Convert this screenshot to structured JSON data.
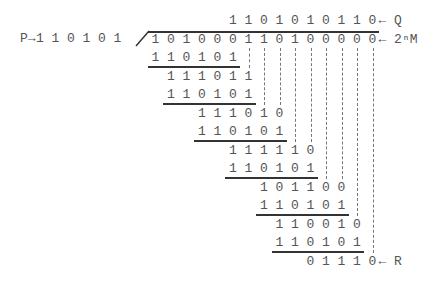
{
  "divisor_label": "P→",
  "divisor_bits": [
    "1",
    "1",
    "0",
    "1",
    "0",
    "1"
  ],
  "quotient_bits": [
    "1",
    "1",
    "0",
    "1",
    "0",
    "1",
    "0",
    "1",
    "1",
    "0"
  ],
  "quotient_label": "← Q",
  "dividend_bits": [
    "1",
    "0",
    "1",
    "0",
    "0",
    "0",
    "1",
    "1",
    "0",
    "1",
    "0",
    "0",
    "0",
    "0",
    "0"
  ],
  "dividend_label": "← 2ⁿM",
  "steps": [
    {
      "subtrahend": [
        "1",
        "1",
        "0",
        "1",
        "0",
        "1"
      ]
    },
    {
      "remainder": [
        "1",
        "1",
        "1",
        "0",
        "1",
        "1"
      ],
      "subtrahend": [
        "1",
        "1",
        "0",
        "1",
        "0",
        "1"
      ]
    },
    {
      "remainder": [
        "1",
        "1",
        "1",
        "0",
        "1",
        "0"
      ],
      "subtrahend": [
        "1",
        "1",
        "0",
        "1",
        "0",
        "1"
      ]
    },
    {
      "remainder": [
        "1",
        "1",
        "1",
        "1",
        "1",
        "0"
      ],
      "subtrahend": [
        "1",
        "1",
        "0",
        "1",
        "0",
        "1"
      ]
    },
    {
      "remainder": [
        "1",
        "0",
        "1",
        "1",
        "0",
        "0"
      ],
      "subtrahend": [
        "1",
        "1",
        "0",
        "1",
        "0",
        "1"
      ]
    },
    {
      "remainder": [
        "1",
        "1",
        "0",
        "0",
        "1",
        "0"
      ],
      "subtrahend": [
        "1",
        "1",
        "0",
        "1",
        "0",
        "1"
      ]
    }
  ],
  "final_remainder": [
    "0",
    "1",
    "1",
    "1",
    "0"
  ],
  "remainder_label": "← R"
}
